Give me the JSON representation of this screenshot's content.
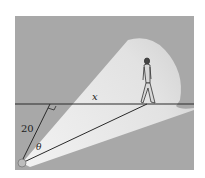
{
  "figure": {
    "labels": {
      "x": "x",
      "distance": "20",
      "angle": "θ"
    },
    "colors": {
      "background": "#a6a6a6",
      "beam": "#e4e4e4",
      "line": "#2a2a2a",
      "page": "#ffffff"
    }
  }
}
